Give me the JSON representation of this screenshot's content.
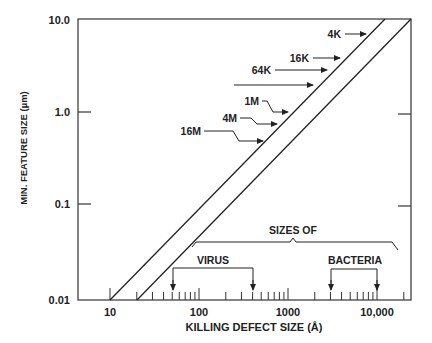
{
  "chart_data": {
    "type": "line",
    "title": "",
    "xlabel": "KILLING DEFECT SIZE (Å)",
    "ylabel": "MIN. FEATURE SIZE (µm)",
    "x_scale": "log",
    "y_scale": "log",
    "xlim": [
      7,
      25000
    ],
    "ylim": [
      0.01,
      10.0
    ],
    "x_ticks": [
      10,
      100,
      1000,
      10000
    ],
    "x_tick_labels": [
      "10",
      "100",
      "1000",
      "10,000"
    ],
    "y_ticks": [
      0.01,
      0.1,
      1.0,
      10.0
    ],
    "y_tick_labels": [
      "0.01",
      "0.1",
      "1.0",
      "10.0"
    ],
    "grid": false,
    "series": [
      {
        "name": "Lower bound (killing defect ≈ feature size)",
        "x": [
          10,
          16000
        ],
        "y": [
          0.01,
          10.0
        ]
      },
      {
        "name": "Upper bound (killing defect ≈ 2× feature size)",
        "x": [
          20,
          30000
        ],
        "y": [
          0.01,
          10.0
        ]
      }
    ],
    "annotations": [
      {
        "text": "4K",
        "arrow_y_um": 6.5
      },
      {
        "text": "16K",
        "arrow_y_um": 3.5
      },
      {
        "text": "64K",
        "arrow_y_um": 2.5
      },
      {
        "text": "",
        "arrow_y_um": 1.7,
        "note": "unlabeled arrow"
      },
      {
        "text": "1M",
        "arrow_y_um": 0.9
      },
      {
        "text": "4M",
        "arrow_y_um": 0.7
      },
      {
        "text": "16M",
        "arrow_y_um": 0.5
      }
    ],
    "ranges": [
      {
        "group": "SIZES OF",
        "name": "VIRUS",
        "x_from": 50,
        "x_to": 400
      },
      {
        "group": "SIZES OF",
        "name": "BACTERIA",
        "x_from": 3000,
        "x_to": 10000
      }
    ]
  },
  "labels": {
    "sizes_of": "SIZES OF",
    "virus": "VIRUS",
    "bacteria": "BACTERIA",
    "mem_4k": "4K",
    "mem_16k": "16K",
    "mem_64k": "64K",
    "mem_1m": "1M",
    "mem_4m": "4M",
    "mem_16m": "16M"
  }
}
